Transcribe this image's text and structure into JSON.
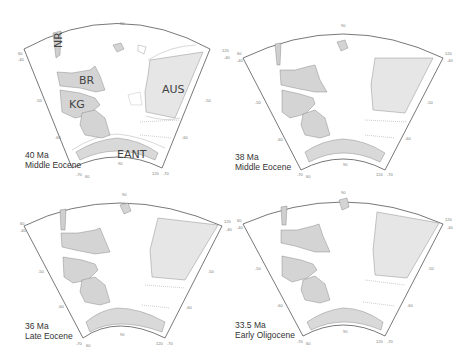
{
  "figure": {
    "colors": {
      "land": "#d9d9d9",
      "land_dark": "#c8c8c8",
      "outline": "#555555",
      "contour": "#9a9a9a",
      "background": "#ffffff"
    },
    "ticks": {
      "top": "90",
      "left_top_lon": "60",
      "left_top_lat": "-40",
      "left_mid": "-50",
      "left_low": "-60",
      "bottom_left_lat": "-70",
      "bottom_left_lon": "60",
      "bottom_mid": "90",
      "bottom_right_lon": "120",
      "bottom_right_lat": "-70",
      "right_low": "-60",
      "right_mid": "-50",
      "right_top_lon": "120",
      "right_top_lat": "-40"
    },
    "regions": {
      "nr": "NR",
      "br": "BR",
      "kg": "KG",
      "aus": "AUS",
      "eant": "EANT"
    },
    "panels": [
      {
        "age": "40 Ma",
        "epoch": "Middle Eocene"
      },
      {
        "age": "38 Ma",
        "epoch": "Middle Eocene"
      },
      {
        "age": "36 Ma",
        "epoch": "Late Eocene"
      },
      {
        "age": "33.5 Ma",
        "epoch": "Early Oligocene"
      }
    ]
  }
}
